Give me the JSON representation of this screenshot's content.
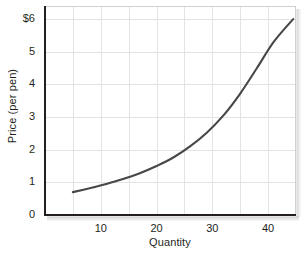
{
  "chart_data": {
    "type": "line",
    "title": "",
    "xlabel": "Quantity",
    "ylabel": "Price (per pen)",
    "xlim": [
      0,
      45
    ],
    "ylim": [
      0,
      6.4
    ],
    "grid": true,
    "legend_position": "none",
    "x_ticks": [
      {
        "value": 10,
        "label": "10"
      },
      {
        "value": 20,
        "label": "20"
      },
      {
        "value": 30,
        "label": "30"
      },
      {
        "value": 40,
        "label": "40"
      }
    ],
    "y_ticks": [
      {
        "value": 0,
        "label": "0"
      },
      {
        "value": 1,
        "label": "1"
      },
      {
        "value": 2,
        "label": "2"
      },
      {
        "value": 3,
        "label": "3"
      },
      {
        "value": 4,
        "label": "4"
      },
      {
        "value": 5,
        "label": "5"
      },
      {
        "value": 6,
        "label": "$6"
      }
    ],
    "x_gridlines": [
      5,
      10,
      15,
      20,
      25,
      30,
      35,
      40
    ],
    "y_gridlines": [
      1,
      2,
      3,
      4,
      5,
      6
    ],
    "series": [
      {
        "name": "Supply",
        "color": "#474747",
        "x": [
          5,
          8,
          11,
          14,
          17,
          20,
          23,
          26,
          29,
          32,
          35,
          38,
          41,
          44.5
        ],
        "y": [
          0.7,
          0.82,
          0.95,
          1.1,
          1.28,
          1.5,
          1.76,
          2.1,
          2.52,
          3.05,
          3.72,
          4.5,
          5.3,
          6.0
        ]
      }
    ]
  },
  "caption": {
    "text": ""
  },
  "colors": {
    "curve": "#474747",
    "grid": "#e2e3e6",
    "axis": "#231f20",
    "plot_background": "#ffffff",
    "page_background": "#ffffff"
  }
}
